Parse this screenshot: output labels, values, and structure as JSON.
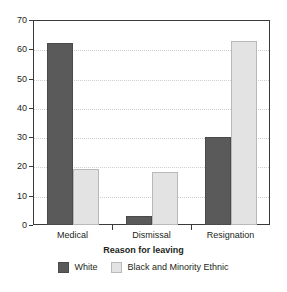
{
  "chart_data": {
    "type": "bar",
    "title": "",
    "xlabel": "Reason for leaving",
    "ylabel": "",
    "categories": [
      "Medical",
      "Dismissal",
      "Resignation"
    ],
    "series": [
      {
        "name": "White",
        "color": "#5a5a5a",
        "values": [
          62,
          3,
          30
        ]
      },
      {
        "name": "Black and Minority Ethnic",
        "color": "#e3e3e3",
        "values": [
          19,
          18,
          63
        ]
      }
    ],
    "ylim": [
      0,
      70
    ],
    "ytick_labels": [
      "0",
      "10",
      "20",
      "30",
      "40",
      "50",
      "60",
      "70"
    ],
    "ytick_values": [
      0,
      10,
      20,
      30,
      40,
      50,
      60,
      70
    ],
    "grid": "horizontal-dotted",
    "legend_position": "bottom-center"
  },
  "axis": {
    "x_title": "Reason for leaving"
  },
  "legend": {
    "items": [
      {
        "label": "White"
      },
      {
        "label": "Black and Minority Ethnic"
      }
    ]
  }
}
